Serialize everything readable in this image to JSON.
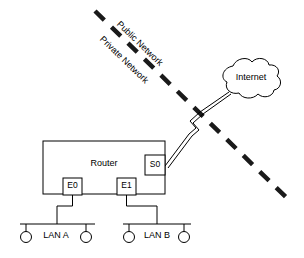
{
  "diagram": {
    "background_color": "#ffffff",
    "line_color": "#000000",
    "divider_color": "#1a1a1a"
  },
  "zones": {
    "public_label": "Public Network",
    "private_label": "Private Network"
  },
  "router": {
    "label": "Router",
    "ports": [
      {
        "id": "E0",
        "label": "E0",
        "type": "ethernet"
      },
      {
        "id": "E1",
        "label": "E1",
        "type": "ethernet"
      },
      {
        "id": "S0",
        "label": "S0",
        "type": "serial"
      }
    ]
  },
  "cloud": {
    "label": "Internet"
  },
  "lans": [
    {
      "id": "lan-a",
      "label": "LAN A",
      "port": "E0",
      "hosts": 2
    },
    {
      "id": "lan-b",
      "label": "LAN B",
      "port": "E1",
      "hosts": 2
    }
  ],
  "links": [
    {
      "from": "S0",
      "to": "Internet",
      "style": "serial-lightning"
    },
    {
      "from": "E0",
      "to": "LAN A",
      "style": "solid"
    },
    {
      "from": "E1",
      "to": "LAN B",
      "style": "solid"
    }
  ]
}
